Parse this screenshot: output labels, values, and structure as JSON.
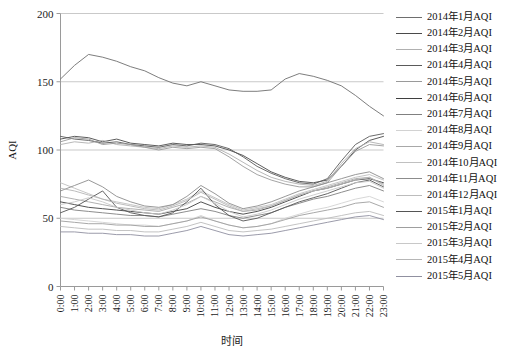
{
  "chart_data": {
    "type": "line",
    "title": "",
    "xlabel": "时间",
    "ylabel": "AQI",
    "ylim": [
      0,
      200
    ],
    "yticks": [
      0,
      50,
      100,
      150,
      200
    ],
    "grid": true,
    "legend_position": "right",
    "x": [
      "0:00",
      "1:00",
      "2:00",
      "3:00",
      "4:00",
      "5:00",
      "6:00",
      "7:00",
      "8:00",
      "9:00",
      "10:00",
      "11:00",
      "12:00",
      "13:00",
      "14:00",
      "15:00",
      "16:00",
      "17:00",
      "18:00",
      "19:00",
      "20:00",
      "21:00",
      "22:00",
      "23:00"
    ],
    "series": [
      {
        "name": "2014年1月AQI",
        "color": "#6e6e6e",
        "values": [
          152,
          162,
          170,
          168,
          165,
          161,
          158,
          153,
          149,
          147,
          150,
          147,
          144,
          143,
          143,
          144,
          152,
          156,
          154,
          151,
          147,
          140,
          132,
          125
        ]
      },
      {
        "name": "2014年2月AQI",
        "color": "#4a4a4a",
        "values": [
          108,
          110,
          109,
          106,
          108,
          105,
          104,
          103,
          105,
          104,
          104,
          103,
          100,
          96,
          90,
          84,
          80,
          77,
          76,
          78,
          88,
          100,
          107,
          110
        ]
      },
      {
        "name": "2014年3月AQI",
        "color": "#b0b0b0",
        "values": [
          104,
          106,
          105,
          107,
          104,
          103,
          102,
          101,
          103,
          102,
          103,
          102,
          97,
          91,
          85,
          80,
          77,
          75,
          74,
          77,
          90,
          101,
          106,
          104
        ]
      },
      {
        "name": "2014年4月AQI",
        "color": "#5a5a5a",
        "values": [
          110,
          108,
          107,
          105,
          106,
          104,
          103,
          102,
          104,
          103,
          105,
          104,
          101,
          95,
          88,
          83,
          79,
          76,
          75,
          79,
          92,
          104,
          110,
          112
        ]
      },
      {
        "name": "2014年5月AQI",
        "color": "#9a9a9a",
        "values": [
          106,
          109,
          108,
          104,
          105,
          104,
          102,
          100,
          102,
          101,
          102,
          101,
          95,
          88,
          82,
          78,
          75,
          73,
          73,
          76,
          88,
          99,
          104,
          103
        ]
      },
      {
        "name": "2014年6月AQI",
        "color": "#3f3f3f",
        "values": [
          62,
          60,
          58,
          57,
          56,
          55,
          54,
          53,
          55,
          57,
          62,
          58,
          55,
          53,
          55,
          58,
          62,
          66,
          70,
          72,
          75,
          78,
          79,
          76
        ]
      },
      {
        "name": "2014年7月AQI",
        "color": "#808080",
        "values": [
          58,
          56,
          55,
          54,
          53,
          52,
          52,
          51,
          53,
          55,
          57,
          55,
          52,
          50,
          52,
          54,
          58,
          61,
          64,
          66,
          69,
          72,
          74,
          70
        ]
      },
      {
        "name": "2014年8月AQI",
        "color": "#d2d2d2",
        "values": [
          50,
          49,
          48,
          47,
          46,
          45,
          45,
          44,
          46,
          48,
          52,
          48,
          45,
          43,
          44,
          46,
          50,
          53,
          56,
          58,
          61,
          64,
          66,
          62
        ]
      },
      {
        "name": "2014年9月AQI",
        "color": "#a8a8a8",
        "values": [
          66,
          64,
          62,
          60,
          58,
          57,
          56,
          55,
          58,
          61,
          66,
          62,
          58,
          55,
          56,
          59,
          63,
          67,
          70,
          73,
          76,
          79,
          80,
          75
        ]
      },
      {
        "name": "2014年10月AQI",
        "color": "#c0c0c0",
        "values": [
          76,
          72,
          68,
          64,
          62,
          60,
          58,
          57,
          60,
          64,
          70,
          65,
          60,
          56,
          58,
          60,
          64,
          68,
          71,
          74,
          77,
          80,
          82,
          78
        ]
      },
      {
        "name": "2014年11月AQI",
        "color": "#8c8c8c",
        "values": [
          70,
          74,
          78,
          73,
          66,
          62,
          59,
          58,
          60,
          66,
          74,
          68,
          61,
          57,
          59,
          62,
          66,
          70,
          73,
          76,
          79,
          82,
          84,
          79
        ]
      },
      {
        "name": "2014年12月AQI",
        "color": "#bcbcbc",
        "values": [
          44,
          43,
          42,
          42,
          41,
          41,
          40,
          40,
          42,
          44,
          47,
          44,
          41,
          40,
          41,
          42,
          44,
          46,
          48,
          50,
          52,
          54,
          55,
          52
        ]
      },
      {
        "name": "2015年1月AQI",
        "color": "#555555",
        "values": [
          54,
          58,
          64,
          70,
          58,
          54,
          52,
          51,
          54,
          62,
          72,
          60,
          52,
          48,
          50,
          54,
          58,
          62,
          65,
          68,
          72,
          76,
          78,
          73
        ]
      },
      {
        "name": "2015年2月AQI",
        "color": "#9e9e9e",
        "values": [
          48,
          47,
          46,
          46,
          45,
          45,
          44,
          44,
          46,
          48,
          51,
          48,
          45,
          43,
          44,
          46,
          49,
          52,
          54,
          56,
          58,
          61,
          62,
          58
        ]
      },
      {
        "name": "2015年3月AQI",
        "color": "#c8c8c8",
        "values": [
          60,
          62,
          65,
          62,
          58,
          56,
          54,
          53,
          56,
          60,
          66,
          61,
          55,
          51,
          53,
          56,
          60,
          64,
          67,
          70,
          73,
          76,
          77,
          72
        ]
      },
      {
        "name": "2015年4月AQI",
        "color": "#b6b6b6",
        "values": [
          72,
          70,
          67,
          64,
          61,
          59,
          57,
          56,
          59,
          63,
          69,
          64,
          59,
          55,
          57,
          59,
          63,
          67,
          70,
          72,
          75,
          78,
          80,
          74
        ]
      },
      {
        "name": "2015年5月AQI",
        "color": "#9090a0",
        "values": [
          40,
          40,
          39,
          39,
          38,
          38,
          37,
          37,
          39,
          41,
          44,
          41,
          38,
          37,
          38,
          39,
          41,
          43,
          45,
          47,
          49,
          51,
          52,
          49
        ]
      }
    ]
  },
  "axes": {
    "y_label": "AQI",
    "x_label": "时间",
    "y_ticks": [
      "0",
      "50",
      "100",
      "150",
      "200"
    ],
    "x_ticks": [
      "0:00",
      "1:00",
      "2:00",
      "3:00",
      "4:00",
      "5:00",
      "6:00",
      "7:00",
      "8:00",
      "9:00",
      "10:00",
      "11:00",
      "12:00",
      "13:00",
      "14:00",
      "15:00",
      "16:00",
      "17:00",
      "18:00",
      "19:00",
      "20:00",
      "21:00",
      "22:00",
      "23:00"
    ]
  }
}
